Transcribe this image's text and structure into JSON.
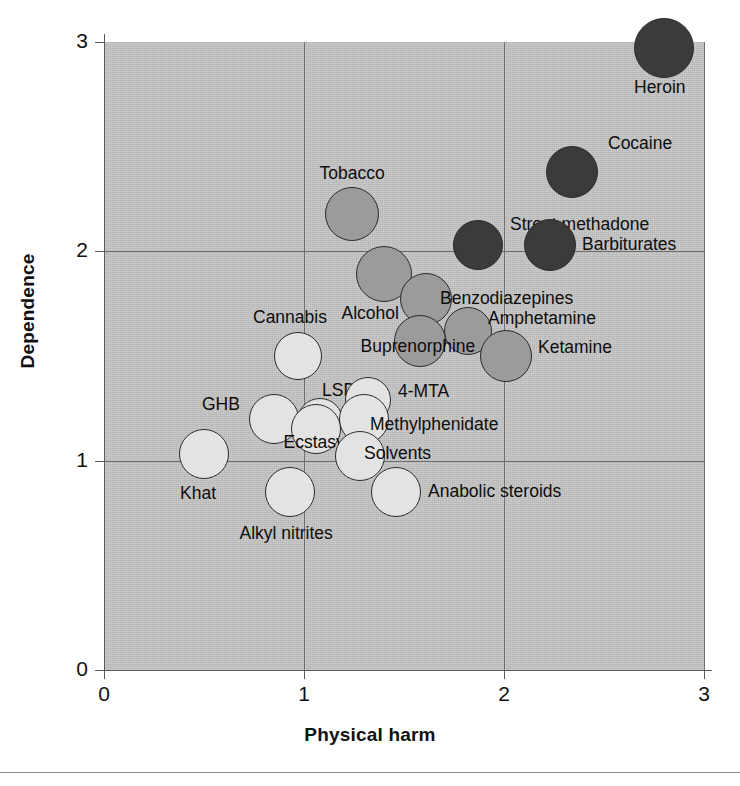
{
  "chart_data": {
    "type": "scatter",
    "title": "",
    "xlabel": "Physical harm",
    "ylabel": "Dependence",
    "xlim": [
      0,
      3
    ],
    "ylim": [
      0,
      3
    ],
    "xticks": [
      "0",
      "1",
      "2",
      "3"
    ],
    "yticks": [
      "0",
      "1",
      "2",
      "3"
    ],
    "grid": true,
    "legend": "none",
    "note": "Bubble shade encodes harm tier: dark = highest, mid = medium, light = lowest.",
    "colors": {
      "plot_background": "#c0c0c0",
      "gridline": "#6f6f6f",
      "bubble_dark": "#3b3b3b",
      "bubble_mid": "#9b9b9b",
      "bubble_light": "#e3e3e3",
      "bubble_outline": "#2b2b2b",
      "text": "#0d0d0d"
    },
    "points": [
      {
        "name": "Heroin",
        "x": 2.8,
        "y": 2.97,
        "r": 30,
        "tier": "dark",
        "label_dx": -4,
        "label_dy": 40,
        "anchor": "middle"
      },
      {
        "name": "Cocaine",
        "x": 2.34,
        "y": 2.38,
        "r": 26,
        "tier": "dark",
        "label_dx": 36,
        "label_dy": -28,
        "anchor": "start"
      },
      {
        "name": "Street methadone",
        "x": 1.87,
        "y": 2.03,
        "r": 25,
        "tier": "dark",
        "label_dx": 32,
        "label_dy": -20,
        "anchor": "start"
      },
      {
        "name": "Barbiturates",
        "x": 2.23,
        "y": 2.03,
        "r": 26,
        "tier": "dark",
        "label_dx": 32,
        "label_dy": 0,
        "anchor": "start"
      },
      {
        "name": "Tobacco",
        "x": 1.24,
        "y": 2.18,
        "r": 27,
        "tier": "mid",
        "label_dx": 0,
        "label_dy": -40,
        "anchor": "middle"
      },
      {
        "name": "Alcohol",
        "x": 1.4,
        "y": 1.89,
        "r": 28,
        "tier": "mid",
        "label_dx": -14,
        "label_dy": 40,
        "anchor": "middle"
      },
      {
        "name": "Benzodiazepines",
        "x": 1.61,
        "y": 1.77,
        "r": 26,
        "tier": "mid",
        "label_dx": 14,
        "label_dy": 0,
        "anchor": "start"
      },
      {
        "name": "Amphetamine",
        "x": 1.82,
        "y": 1.62,
        "r": 24,
        "tier": "mid",
        "label_dx": 20,
        "label_dy": -12,
        "anchor": "start"
      },
      {
        "name": "Buprenorphine",
        "x": 1.58,
        "y": 1.57,
        "r": 26,
        "tier": "mid",
        "label_dx": -2,
        "label_dy": 6,
        "anchor": "middle"
      },
      {
        "name": "Ketamine",
        "x": 2.01,
        "y": 1.5,
        "r": 26,
        "tier": "mid",
        "label_dx": 32,
        "label_dy": -8,
        "anchor": "start"
      },
      {
        "name": "Cannabis",
        "x": 0.97,
        "y": 1.5,
        "r": 24,
        "tier": "light",
        "label_dx": -8,
        "label_dy": -38,
        "anchor": "middle"
      },
      {
        "name": "LSD",
        "x": 1.08,
        "y": 1.19,
        "r": 23,
        "tier": "light",
        "label_dx": 2,
        "label_dy": -30,
        "anchor": "start"
      },
      {
        "name": "GHB",
        "x": 0.85,
        "y": 1.2,
        "r": 25,
        "tier": "light",
        "label_dx": -34,
        "label_dy": -14,
        "anchor": "end"
      },
      {
        "name": "4-MTA",
        "x": 1.32,
        "y": 1.29,
        "r": 23,
        "tier": "light",
        "label_dx": 30,
        "label_dy": -8,
        "anchor": "start"
      },
      {
        "name": "Methylphenidate",
        "x": 1.3,
        "y": 1.2,
        "r": 25,
        "tier": "light",
        "label_dx": 6,
        "label_dy": 6,
        "anchor": "start"
      },
      {
        "name": "Ecstasy",
        "x": 1.06,
        "y": 1.15,
        "r": 25,
        "tier": "light",
        "label_dx": -2,
        "label_dy": 14,
        "anchor": "middle"
      },
      {
        "name": "Solvents",
        "x": 1.28,
        "y": 1.02,
        "r": 25,
        "tier": "light",
        "label_dx": 4,
        "label_dy": -2,
        "anchor": "start"
      },
      {
        "name": "Khat",
        "x": 0.5,
        "y": 1.03,
        "r": 25,
        "tier": "light",
        "label_dx": -6,
        "label_dy": 40,
        "anchor": "middle"
      },
      {
        "name": "Alkyl nitrites",
        "x": 0.93,
        "y": 0.85,
        "r": 25,
        "tier": "light",
        "label_dx": -4,
        "label_dy": 42,
        "anchor": "middle"
      },
      {
        "name": "Anabolic steroids",
        "x": 1.46,
        "y": 0.85,
        "r": 25,
        "tier": "light",
        "label_dx": 32,
        "label_dy": 0,
        "anchor": "start"
      }
    ]
  },
  "axes": {
    "x": {
      "label": "Physical harm",
      "ticks": [
        "0",
        "1",
        "2",
        "3"
      ]
    },
    "y": {
      "label": "Dependence",
      "ticks": [
        "0",
        "1",
        "2",
        "3"
      ]
    }
  }
}
